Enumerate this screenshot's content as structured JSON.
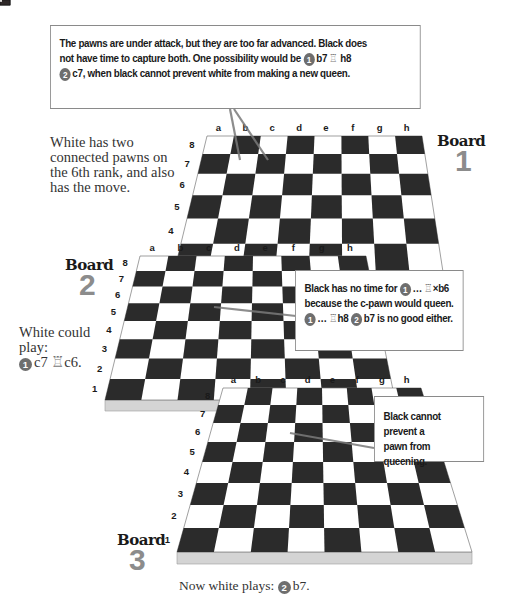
{
  "colors": {
    "dark_square": "#2b2b2b",
    "light_square": "#ffffff",
    "slab": "#d4d4d4",
    "board_number": "#8c8c8c",
    "callout_border": "#8a8a8a",
    "pointer_line": "#7a7a7a",
    "move_badge": "#6e6e6e"
  },
  "files": [
    "a",
    "b",
    "c",
    "d",
    "e",
    "f",
    "g",
    "h"
  ],
  "ranks": [
    "8",
    "7",
    "6",
    "5",
    "4",
    "3",
    "2",
    "1"
  ],
  "boards": [
    {
      "title": "Board",
      "number": "1",
      "side_text": [
        "White has two",
        "connected pawns on",
        "the 6th rank, and also",
        "has the move."
      ],
      "pieces": [
        {
          "piece": "white-pawn",
          "square": "b6"
        },
        {
          "piece": "white-pawn",
          "square": "c6"
        },
        {
          "piece": "black-rook",
          "square": "h7"
        }
      ],
      "callout": {
        "lines": [
          [
            {
              "t": "The pawns are under attack, but they are too far advanced. Black does"
            }
          ],
          [
            {
              "t": "not have time to capture both. One possibility would be "
            },
            {
              "badge": "1"
            },
            {
              "t": "b7 "
            },
            {
              "rook": "♖"
            },
            {
              "t": " h8"
            }
          ],
          [
            {
              "badge": "2"
            },
            {
              "t": "c7, when black cannot prevent white from making a new queen."
            }
          ]
        ]
      }
    },
    {
      "title": "Board",
      "number": "2",
      "side_text": [
        "White could",
        "play:"
      ],
      "side_move": {
        "badge": "1",
        "text": "c7 ",
        "rook": "♖",
        "text2": "c6."
      },
      "pieces": [
        {
          "piece": "white-pawn",
          "square": "b6"
        },
        {
          "piece": "white-pawn",
          "square": "c7"
        },
        {
          "piece": "black-rook",
          "square": "c6"
        }
      ],
      "callout": {
        "lines": [
          [
            {
              "t": "Black has no time for "
            },
            {
              "badge": "1"
            },
            {
              "t": "… "
            },
            {
              "rook": "♖"
            },
            {
              "t": "×b6"
            }
          ],
          [
            {
              "t": "because the c-pawn would queen."
            }
          ],
          [
            {
              "badge": "1"
            },
            {
              "t": "… "
            },
            {
              "rook": "♖"
            },
            {
              "t": "h8 "
            },
            {
              "badge": "2"
            },
            {
              "t": "b7 is no good either."
            }
          ]
        ]
      }
    },
    {
      "title": "Board",
      "number": "3",
      "pieces": [
        {
          "piece": "white-pawn",
          "square": "b7"
        },
        {
          "piece": "white-pawn",
          "square": "c7"
        },
        {
          "piece": "black-rook",
          "square": "c6"
        }
      ],
      "callout": {
        "lines": [
          [
            {
              "t": "Black cannot prevent a"
            }
          ],
          [
            {
              "t": "pawn from queening."
            }
          ]
        ]
      },
      "caption": {
        "text": "Now white plays: ",
        "badge": "2",
        "move": "b7."
      }
    }
  ]
}
